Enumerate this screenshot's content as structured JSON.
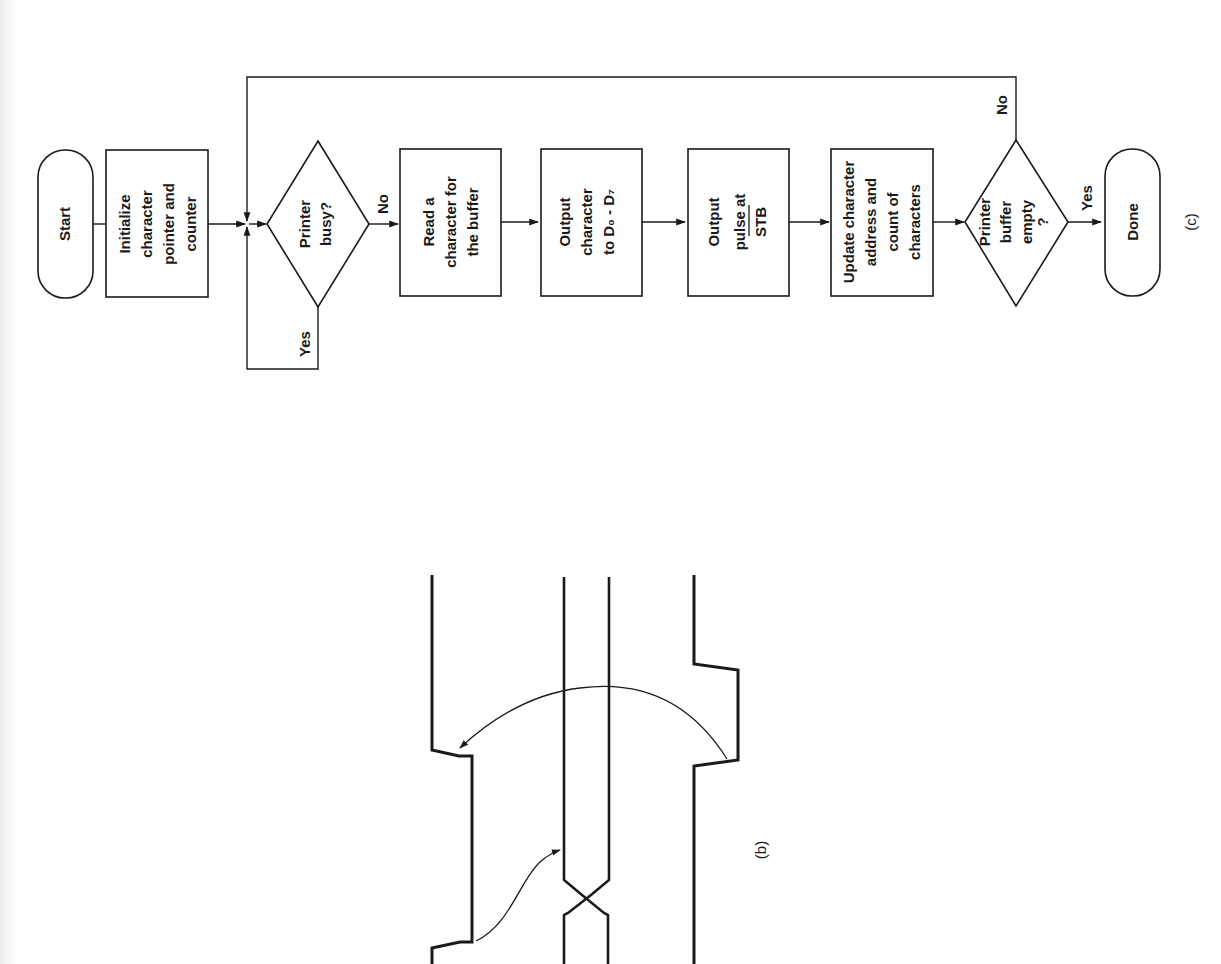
{
  "flowchart": {
    "caption": "(c)",
    "nodes": [
      {
        "id": "start",
        "type": "terminal",
        "lines": [
          "Start"
        ]
      },
      {
        "id": "init",
        "type": "process",
        "lines": [
          "Initialize",
          "character",
          "pointer and",
          "counter"
        ]
      },
      {
        "id": "busy",
        "type": "decision",
        "lines": [
          "Printer",
          "busy?"
        ]
      },
      {
        "id": "read",
        "type": "process",
        "lines": [
          "Read a",
          "character for",
          "the buffer"
        ]
      },
      {
        "id": "output_char",
        "type": "process",
        "lines": [
          "Output",
          "character",
          "to D₀ - D₇"
        ]
      },
      {
        "id": "output_pulse",
        "type": "process",
        "lines": [
          "Output",
          "pulse at",
          "STB"
        ]
      },
      {
        "id": "update",
        "type": "process",
        "lines": [
          "Update character",
          "address and",
          "count of",
          "characters"
        ]
      },
      {
        "id": "empty",
        "type": "decision",
        "lines": [
          "Printer",
          "buffer",
          "empty",
          "?"
        ]
      },
      {
        "id": "done",
        "type": "terminal",
        "lines": [
          "Done"
        ]
      }
    ],
    "edge_labels": {
      "busy_no": "No",
      "busy_yes": "Yes",
      "empty_no": "No",
      "empty_yes": "Yes"
    }
  },
  "timing_diagram": {
    "caption": "(b)"
  }
}
